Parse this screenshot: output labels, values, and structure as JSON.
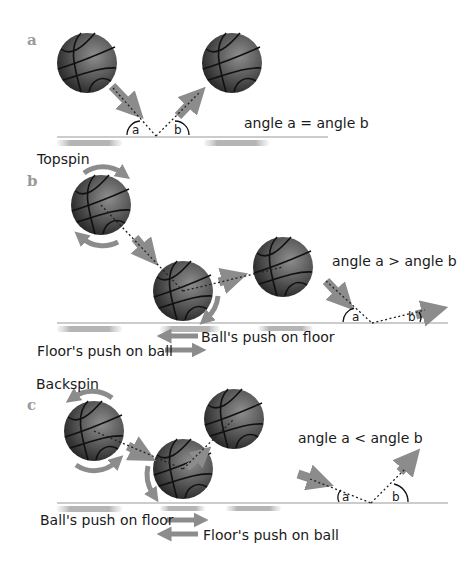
{
  "panels": {
    "a": {
      "letter": "a",
      "caption": "angle a = angle b",
      "angle_a": "a",
      "angle_b": "b"
    },
    "b": {
      "letter": "b",
      "spin_label": "Topspin",
      "caption": "angle a > angle b",
      "ball_push": "Ball's push on floor",
      "floor_push": "Floor's push on ball",
      "angle_a": "a",
      "angle_b": "b"
    },
    "c": {
      "letter": "c",
      "spin_label": "Backspin",
      "caption": "angle a < angle b",
      "ball_push": "Ball's push on floor",
      "floor_push": "Floor's push on ball",
      "angle_a": "a",
      "angle_b": "b"
    }
  },
  "colors": {
    "ball_dark": "#2a2a2a",
    "ball_light": "#8a8a8a",
    "arrow": "#8c8c8c",
    "floor": "#9a9a9a",
    "text": "#1a1a1a"
  }
}
